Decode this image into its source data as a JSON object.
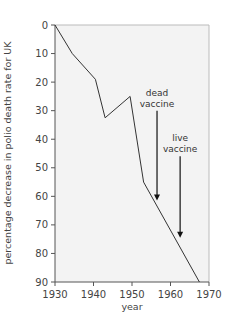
{
  "chart_data": {
    "type": "line",
    "title": "",
    "xlabel": "year",
    "ylabel": "percentage decrease in polio death rate for UK",
    "xlim": [
      1930,
      1970
    ],
    "ylim": [
      0,
      90
    ],
    "y_inverted": true,
    "x_ticks": [
      1930,
      1940,
      1950,
      1960,
      1970
    ],
    "y_ticks": [
      0,
      10,
      20,
      30,
      40,
      50,
      60,
      70,
      80,
      90
    ],
    "grid": false,
    "legend": null,
    "series": [
      {
        "name": "polio death rate decrease",
        "x": [
          1930,
          1934.5,
          1940.5,
          1943,
          1949.5,
          1953,
          1967.5
        ],
        "y": [
          0,
          10,
          19,
          32.5,
          25,
          55,
          90
        ]
      }
    ],
    "annotations": [
      {
        "text_lines": [
          "dead",
          "vaccine"
        ],
        "year": 1956.5,
        "arrow_from": 30,
        "arrow_to": 61.5
      },
      {
        "text_lines": [
          "live",
          "vaccine"
        ],
        "year": 1962.5,
        "arrow_from": 46,
        "arrow_to": 74.5
      }
    ]
  },
  "colors": {
    "plot_background": "#f3f3f3",
    "line": "#333333",
    "axis": "#555555",
    "frame": "#bbbbbb"
  }
}
